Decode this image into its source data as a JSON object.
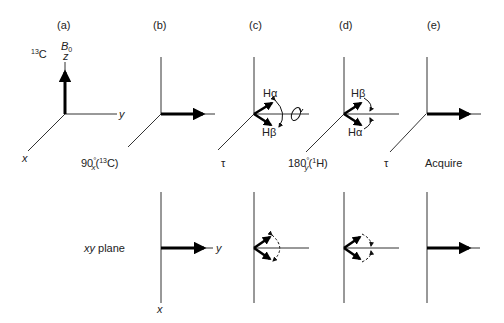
{
  "figure": {
    "panels": [
      {
        "id": "a",
        "label": "(a)",
        "step": "",
        "nucleus": "13C",
        "field": "B0"
      },
      {
        "id": "b",
        "label": "(b)",
        "step": "90°x(13C)"
      },
      {
        "id": "c",
        "label": "(c)",
        "step": "τ",
        "top_vector": "Hα",
        "bottom_vector": "Hβ"
      },
      {
        "id": "d",
        "label": "(d)",
        "step": "180°y(1H)",
        "top_vector": "Hβ",
        "bottom_vector": "Hα"
      },
      {
        "id": "e",
        "label": "(e)",
        "step": "Acquire"
      }
    ],
    "axes": {
      "x": "x",
      "y": "y",
      "z": "z"
    },
    "labels": {
      "a_tag": "(a)",
      "b_tag": "(b)",
      "c_tag": "(c)",
      "d_tag": "(d)",
      "e_tag": "(e)",
      "nucleus_mass": "13",
      "nucleus_symbol": "C",
      "field_B": "B",
      "field_sub": "0",
      "step_b_num": "90",
      "step_b_deg": "°",
      "step_b_sub": "x",
      "step_b_open": "(",
      "step_b_mass": "13",
      "step_b_sym": "C)",
      "step_c": "τ",
      "step_d_num": "180",
      "step_d_deg": "°",
      "step_d_sub": "y",
      "step_d_open": "(",
      "step_d_mass": "1",
      "step_d_sym": "H)",
      "step_e": "τ",
      "acquire": "Acquire",
      "c_top": "Hα",
      "c_bottom": "Hβ",
      "d_top": "Hβ",
      "d_bottom": "Hα",
      "xy_plane_italic": "xy",
      "xy_plane_rest": " plane",
      "axis_x": "x",
      "axis_y": "y",
      "axis_z": "z"
    }
  }
}
